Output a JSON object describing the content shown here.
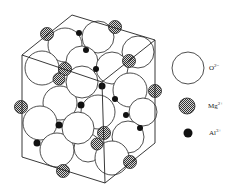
{
  "figure": {
    "type": "crystal-structure-diagram"
  },
  "legend": [
    {
      "ion": "O",
      "charge": "2−",
      "symbol": "large-open-circle"
    },
    {
      "ion": "Mg",
      "charge": "2+",
      "symbol": "hatched-circle"
    },
    {
      "ion": "Al",
      "charge": "3+",
      "symbol": "small-black-dot"
    }
  ],
  "colors": {
    "line": "#222222",
    "oxygen_fill": "#ffffff",
    "mg_fill": "#9a9a9a",
    "al_fill": "#111111"
  }
}
